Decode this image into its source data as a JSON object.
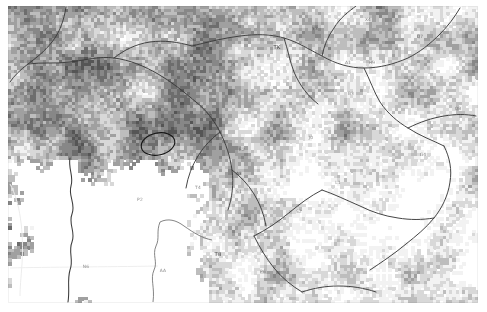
{
  "document": {
    "kind": "raster-map-figure",
    "title": "",
    "background_color": "#ffffff",
    "plate_color": "#fdfdfd"
  },
  "map": {
    "type": "classified-raster-satellite-map",
    "rendering": "grayscale pixelated land-cover classification",
    "frame": {
      "x": 8,
      "y": 6,
      "width": 470,
      "height": 297
    },
    "cell_size_px": 3.2,
    "palette": {
      "nodata": "#ffffff",
      "lightest": "#f2f2f2",
      "light": "#d8d8d8",
      "mid_light": "#bdbdbd",
      "mid": "#a0a0a0",
      "mid_dark": "#878787",
      "dark": "#6d6d6d",
      "darkest": "#555555",
      "vector_line": "#3b3b3b",
      "faint_boundary": "#e4e4e4",
      "annotation": "#141414"
    },
    "nodata_region": {
      "description": "large blank white area in lower-left quadrant",
      "approx_bounds": {
        "x": 0,
        "y": 160,
        "width": 190,
        "height": 137
      }
    }
  },
  "labels": [
    {
      "text": "F4",
      "x": 52,
      "y": 148,
      "style": "pale"
    },
    {
      "text": "D4",
      "x": 200,
      "y": 107,
      "style": "pale"
    },
    {
      "text": "J4",
      "x": 225,
      "y": 58,
      "style": "pale"
    },
    {
      "text": "Y3",
      "x": 307,
      "y": 22,
      "style": "pale"
    },
    {
      "text": "X4",
      "x": 360,
      "y": 13,
      "style": "pale"
    },
    {
      "text": "TK",
      "x": 269,
      "y": 41,
      "style": "big"
    },
    {
      "text": "E2",
      "x": 234,
      "y": 143,
      "style": "pale"
    },
    {
      "text": "J0",
      "x": 303,
      "y": 131,
      "style": "pale"
    },
    {
      "text": "A3",
      "x": 231,
      "y": 167,
      "style": "pale"
    },
    {
      "text": "T4",
      "x": 190,
      "y": 181,
      "style": "pale"
    },
    {
      "text": "S1",
      "x": 231,
      "y": 185,
      "style": "pale"
    },
    {
      "text": "S2",
      "x": 291,
      "y": 205,
      "style": "pale"
    },
    {
      "text": "B3",
      "x": 343,
      "y": 87,
      "style": "pale"
    },
    {
      "text": "A1",
      "x": 340,
      "y": 56,
      "style": "pale"
    },
    {
      "text": "P2",
      "x": 132,
      "y": 193,
      "style": "pale"
    },
    {
      "text": "T8",
      "x": 210,
      "y": 248,
      "style": "big"
    },
    {
      "text": "AA",
      "x": 155,
      "y": 264,
      "style": "pale"
    },
    {
      "text": "Q7",
      "x": 412,
      "y": 30,
      "style": "pale"
    },
    {
      "text": "Q8",
      "x": 450,
      "y": 102,
      "style": "pale"
    },
    {
      "text": "G4",
      "x": 415,
      "y": 148,
      "style": "pale"
    },
    {
      "text": "L1",
      "x": 330,
      "y": 176,
      "style": "pale"
    },
    {
      "text": "N6",
      "x": 78,
      "y": 260,
      "style": "pale"
    },
    {
      "text": "P6",
      "x": 255,
      "y": 265,
      "style": "pale"
    },
    {
      "text": "H9",
      "x": 364,
      "y": 56,
      "style": "pale"
    }
  ],
  "annotations": [
    {
      "name": "highlight-ellipse",
      "shape": "ellipse",
      "cx": 150,
      "cy": 138,
      "rx": 17,
      "ry": 11,
      "rotation_deg": -12,
      "stroke": "#141414",
      "stroke_width": 1.1
    }
  ],
  "vectors": {
    "roads_rivers": "dark thin polylines tracing drainage and road network across the raster",
    "faint_boundary": "pale grey administrative boundary crossing the blank lower-left area"
  }
}
